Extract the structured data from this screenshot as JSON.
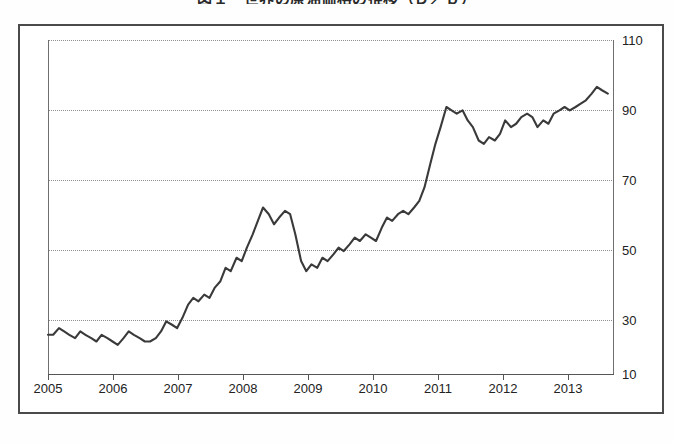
{
  "chart_data": {
    "type": "line",
    "title": "図１　世界の原油価格の推移（Ｄ／ｂ）",
    "xlabel": "",
    "ylabel": "",
    "xlim": [
      2005.0,
      2013.75
    ],
    "ylim": [
      10,
      110
    ],
    "yticks": [
      10,
      30,
      50,
      70,
      90,
      110
    ],
    "ytick_labels": [
      "10",
      "30",
      "50",
      "70",
      "90",
      "110"
    ],
    "xticks": [
      2005,
      2006,
      2007,
      2008,
      2009,
      2010,
      2011,
      2012,
      2013
    ],
    "xtick_labels": [
      "2005",
      "2006",
      "2007",
      "2008",
      "2009",
      "2010",
      "2011",
      "2012",
      "2013"
    ],
    "grid": true,
    "grid_axis": "y",
    "grid_style": "dotted",
    "legend": false,
    "y_axis_position": "right",
    "line_color": "#3a3a3a",
    "background_color": "#ffffff",
    "series": [
      {
        "name": "price",
        "x": [
          2005.0,
          2005.08,
          2005.17,
          2005.25,
          2005.33,
          2005.42,
          2005.5,
          2005.58,
          2005.67,
          2005.75,
          2005.83,
          2005.92,
          2006.0,
          2006.08,
          2006.17,
          2006.25,
          2006.33,
          2006.42,
          2006.5,
          2006.58,
          2006.67,
          2006.75,
          2006.83,
          2006.92,
          2007.0,
          2007.08,
          2007.17,
          2007.25,
          2007.33,
          2007.42,
          2007.5,
          2007.58,
          2007.67,
          2007.75,
          2007.83,
          2007.92,
          2008.0,
          2008.08,
          2008.17,
          2008.25,
          2008.33,
          2008.42,
          2008.5,
          2008.58,
          2008.67,
          2008.75,
          2008.83,
          2008.92,
          2009.0,
          2009.08,
          2009.17,
          2009.25,
          2009.33,
          2009.42,
          2009.5,
          2009.58,
          2009.67,
          2009.75,
          2009.83,
          2009.92,
          2010.0,
          2010.08,
          2010.17,
          2010.25,
          2010.33,
          2010.42,
          2010.5,
          2010.58,
          2010.67,
          2010.75,
          2010.83,
          2010.92,
          2011.0,
          2011.08,
          2011.17,
          2011.25,
          2011.33,
          2011.42,
          2011.5,
          2011.58,
          2011.67,
          2011.75,
          2011.83,
          2011.92,
          2012.0,
          2012.08,
          2012.17,
          2012.25,
          2012.33,
          2012.42,
          2012.5,
          2012.58,
          2012.67,
          2012.75,
          2012.83,
          2012.92,
          2013.0,
          2013.08,
          2013.17,
          2013.25,
          2013.33,
          2013.42,
          2013.5,
          2013.58,
          2013.67
        ],
        "y": [
          22,
          22,
          24,
          23,
          22,
          21,
          23,
          22,
          21,
          20,
          22,
          21,
          20,
          19,
          21,
          23,
          22,
          21,
          20,
          20,
          21,
          23,
          26,
          25,
          24,
          27,
          31,
          33,
          32,
          34,
          33,
          36,
          38,
          42,
          41,
          45,
          44,
          48,
          52,
          56,
          60,
          58,
          55,
          57,
          59,
          58,
          52,
          44,
          41,
          43,
          42,
          45,
          44,
          46,
          48,
          47,
          49,
          51,
          50,
          52,
          51,
          50,
          54,
          57,
          56,
          58,
          59,
          58,
          60,
          62,
          66,
          73,
          79,
          84,
          90,
          89,
          88,
          89,
          86,
          84,
          80,
          79,
          81,
          80,
          82,
          86,
          84,
          85,
          87,
          88,
          87,
          84,
          86,
          85,
          88,
          89,
          90,
          89,
          90,
          91,
          92,
          94,
          96,
          95,
          94
        ]
      }
    ]
  },
  "axes": {
    "y_ticks": [
      {
        "label": "110",
        "top": 34
      },
      {
        "label": "90",
        "top": 104
      },
      {
        "label": "70",
        "top": 174
      },
      {
        "label": "50",
        "top": 244
      },
      {
        "label": "30",
        "top": 314
      },
      {
        "label": "10",
        "top": 368
      }
    ],
    "x_ticks": [
      {
        "label": "2005",
        "left": 48
      },
      {
        "label": "2006",
        "left": 113
      },
      {
        "label": "2007",
        "left": 178
      },
      {
        "label": "2008",
        "left": 243
      },
      {
        "label": "2009",
        "left": 308
      },
      {
        "label": "2010",
        "left": 373
      },
      {
        "label": "2011",
        "left": 438
      },
      {
        "label": "2012",
        "left": 503
      },
      {
        "label": "2013",
        "left": 568
      }
    ]
  }
}
